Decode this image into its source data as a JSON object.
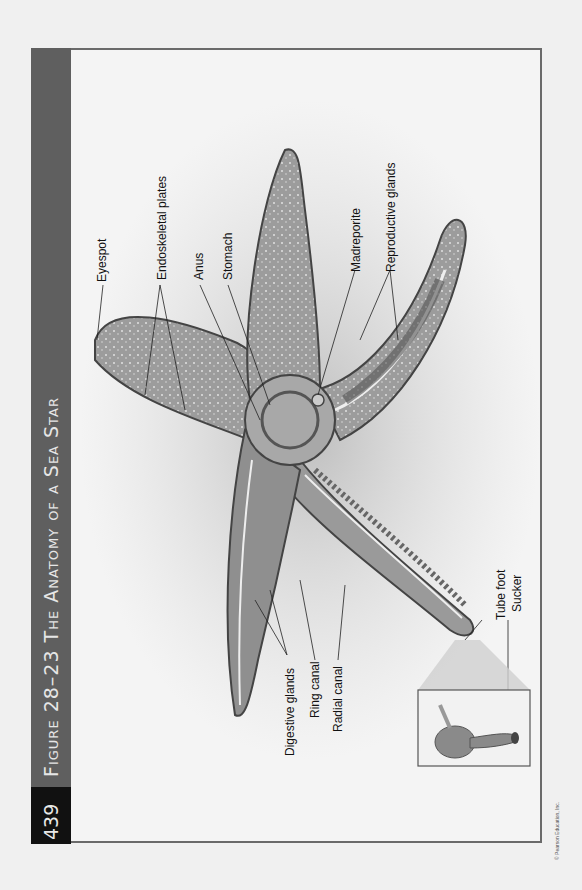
{
  "figure": {
    "page_number": "439",
    "title": "Figure 28–23  The Anatomy of a Sea Star"
  },
  "labels": {
    "eyespot": "Eyespot",
    "endoskeletal_plates": "Endoskeletal plates",
    "anus": "Anus",
    "stomach": "Stomach",
    "madreporite": "Madreporite",
    "reproductive_glands": "Reproductive glands",
    "digestive_glands": "Digestive glands",
    "ring_canal": "Ring canal",
    "radial_canal": "Radial canal",
    "tube_foot": "Tube foot",
    "sucker": "Sucker"
  },
  "copyright": "© Pearson Education, Inc.",
  "colors": {
    "header_bar": "#5f5f5f",
    "page_box": "#111111",
    "header_text": "#e6e6e6",
    "star_body": "#9a9a9a",
    "star_outline": "#444444"
  }
}
